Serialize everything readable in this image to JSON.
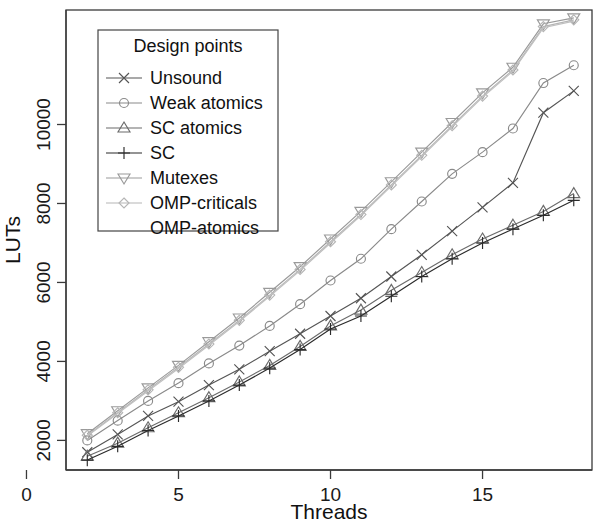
{
  "figure": {
    "name": "lut-usage-vs-threads",
    "background": "#ffffff",
    "frame_color": "#3a3a3a"
  },
  "chart_data": {
    "type": "line",
    "title": "",
    "xlabel": "Threads",
    "ylabel": "LUTs",
    "xlim": [
      1.3,
      18.6
    ],
    "ylim": [
      1250,
      12900
    ],
    "xticks": [
      0,
      5,
      10,
      15
    ],
    "xticklabels": [
      "0",
      "5",
      "10",
      "15"
    ],
    "yticks": [
      2000,
      4000,
      6000,
      8000,
      10000
    ],
    "yticklabels": [
      "2000",
      "4000",
      "6000",
      "8000",
      "10000"
    ],
    "grid": false,
    "legend": {
      "title": "Design points",
      "position": "upper-left-inset"
    },
    "x": [
      2,
      3,
      4,
      5,
      6,
      7,
      8,
      9,
      10,
      11,
      12,
      13,
      14,
      15,
      16,
      17,
      18
    ],
    "series": [
      {
        "name": "Unsound",
        "marker": "x",
        "color": "#555555",
        "values": [
          1700,
          2150,
          2620,
          2980,
          3400,
          3800,
          4260,
          4700,
          5150,
          5600,
          6150,
          6700,
          7300,
          7900,
          8520,
          10300,
          10850
        ]
      },
      {
        "name": "Weak atomics",
        "marker": "circle",
        "color": "#8a8a8a",
        "values": [
          2000,
          2500,
          3000,
          3450,
          3950,
          4400,
          4900,
          5450,
          6050,
          6600,
          7350,
          8050,
          8750,
          9300,
          9900,
          11050,
          11500
        ]
      },
      {
        "name": "SC atomics",
        "marker": "triangle-up",
        "color": "#6b6b6b",
        "values": [
          1600,
          1930,
          2320,
          2700,
          3080,
          3480,
          3900,
          4380,
          4900,
          5300,
          5800,
          6250,
          6700,
          7100,
          7450,
          7800,
          8250
        ]
      },
      {
        "name": "SC",
        "marker": "plus",
        "color": "#2b2b2b",
        "values": [
          1500,
          1850,
          2250,
          2620,
          3000,
          3400,
          3830,
          4300,
          4820,
          5150,
          5650,
          6150,
          6600,
          7000,
          7350,
          7700,
          8080
        ]
      },
      {
        "name": "Mutexes",
        "marker": "triangle-down",
        "color": "#9a9a9a",
        "values": [
          2170,
          2750,
          3330,
          3900,
          4500,
          5100,
          5750,
          6400,
          7100,
          7800,
          8550,
          9300,
          10050,
          10800,
          11450,
          12550,
          12700
        ]
      },
      {
        "name": "OMP-criticals",
        "marker": "diamond",
        "color": "#b5b5b5",
        "values": [
          2130,
          2700,
          3280,
          3850,
          4440,
          5040,
          5680,
          6330,
          7030,
          7720,
          8470,
          9220,
          9970,
          10720,
          11380,
          12480,
          12650
        ]
      },
      {
        "name": "OMP-atomics",
        "marker": "none",
        "color": "#c0c0c0",
        "values": [
          2110,
          2680,
          3250,
          3820,
          4410,
          5010,
          5650,
          6300,
          7000,
          7690,
          8440,
          9190,
          9940,
          10690,
          11350,
          12450,
          12620
        ]
      }
    ]
  },
  "legend_entries": [
    {
      "label": "Unsound",
      "marker": "x"
    },
    {
      "label": "Weak atomics",
      "marker": "circle"
    },
    {
      "label": "SC atomics",
      "marker": "triangle-up"
    },
    {
      "label": "SC",
      "marker": "plus"
    },
    {
      "label": "Mutexes",
      "marker": "triangle-down"
    },
    {
      "label": "OMP-criticals",
      "marker": "diamond"
    },
    {
      "label": "OMP-atomics",
      "marker": "none"
    }
  ]
}
